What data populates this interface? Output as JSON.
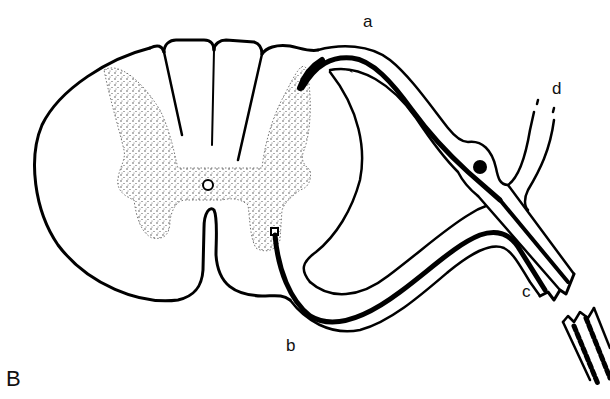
{
  "figure": {
    "panel_label": "B",
    "colors": {
      "line": "#000000",
      "background": "#ffffff",
      "stipple": "#333333"
    }
  },
  "labels": {
    "a": "a",
    "b": "b",
    "c": "c",
    "d": "d"
  }
}
